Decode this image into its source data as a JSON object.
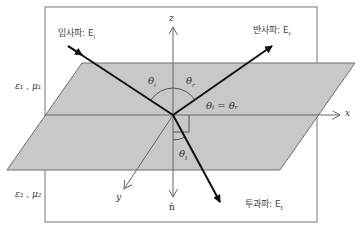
{
  "figure": {
    "colors": {
      "plane_fill": "#c8c8c8",
      "plane_stroke": "#6e6e6e",
      "box_stroke": "#777777",
      "ray": "#111111",
      "axis": "#666666"
    }
  },
  "labels": {
    "incident": "입사파: E",
    "incident_sub": "i",
    "reflected": "반사파: E",
    "reflected_sub": "r",
    "transmitted": "투과파: E",
    "transmitted_sub": "t",
    "medium1": "ε₁ , μ₁",
    "medium2": "ε₂ , μ₂",
    "axis_x": "x",
    "axis_y": "y",
    "axis_z": "z",
    "normal": "n̂",
    "theta_i": "θ",
    "theta_i_sub": "i",
    "theta_r": "θ",
    "theta_r_sub": "r",
    "theta_t": "θ",
    "theta_t_sub": "t",
    "law_of_reflection": "θᵢ = θᵣ"
  }
}
